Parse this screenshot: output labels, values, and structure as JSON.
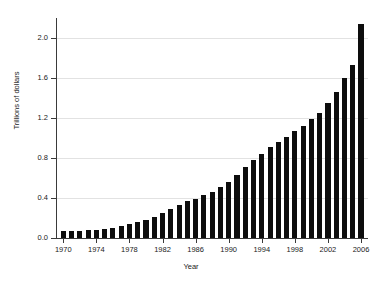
{
  "chart_data": {
    "type": "bar",
    "title": "",
    "xlabel": "Year",
    "ylabel": "Trillions of dollars",
    "xlim": [
      1969.5,
      2006.5
    ],
    "ylim": [
      0.0,
      2.2
    ],
    "grid": true,
    "legend": null,
    "y_ticks": [
      "0.0",
      "0.4",
      "0.8",
      "1.2",
      "1.6",
      "2.0"
    ],
    "y_tick_values": [
      0.0,
      0.4,
      0.8,
      1.2,
      1.6,
      2.0
    ],
    "x_ticks": [
      "1970",
      "1974",
      "1978",
      "1982",
      "1986",
      "1990",
      "1994",
      "1998",
      "2002",
      "2006"
    ],
    "x_tick_values": [
      1970,
      1974,
      1978,
      1982,
      1986,
      1990,
      1994,
      1998,
      2002,
      2006
    ],
    "bar_color": "#0d0d0d",
    "grid_color": "#e2e2e2",
    "axis_color": "#3a3a3a",
    "categories": [
      1970,
      1971,
      1972,
      1973,
      1974,
      1975,
      1976,
      1977,
      1978,
      1979,
      1980,
      1981,
      1982,
      1983,
      1984,
      1985,
      1986,
      1987,
      1988,
      1989,
      1990,
      1991,
      1992,
      1993,
      1994,
      1995,
      1996,
      1997,
      1998,
      1999,
      2000,
      2001,
      2002,
      2003,
      2004,
      2005,
      2006
    ],
    "values": [
      0.07,
      0.07,
      0.07,
      0.08,
      0.08,
      0.09,
      0.1,
      0.12,
      0.14,
      0.16,
      0.18,
      0.21,
      0.25,
      0.29,
      0.33,
      0.37,
      0.39,
      0.43,
      0.46,
      0.51,
      0.56,
      0.63,
      0.71,
      0.78,
      0.84,
      0.91,
      0.96,
      1.01,
      1.07,
      1.12,
      1.19,
      1.25,
      1.35,
      1.46,
      1.6,
      1.73,
      2.14
    ]
  }
}
